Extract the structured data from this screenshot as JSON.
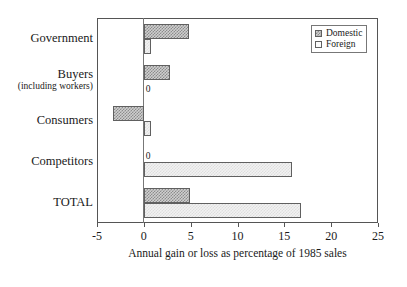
{
  "chart_data": {
    "type": "bar",
    "orientation": "horizontal",
    "title": "",
    "subtitle": "",
    "xlabel": "Annual gain or loss as percentage of 1985 sales",
    "ylabel": "",
    "xlim": [
      -5,
      25
    ],
    "xticks": [
      -5,
      0,
      5,
      10,
      15,
      20,
      25
    ],
    "xticklabels": [
      "-5",
      "0",
      "5",
      "10",
      "15",
      "20",
      "25"
    ],
    "grid": false,
    "legend_position": "top-right",
    "categories": [
      "Government",
      "Buyers",
      "Consumers",
      "Competitors",
      "TOTAL"
    ],
    "category_sublabels": [
      "",
      "(including workers)",
      "",
      "",
      ""
    ],
    "series": [
      {
        "name": "Domestic",
        "values": [
          4.8,
          2.8,
          -3.3,
          0,
          4.9
        ],
        "fill": "dark-checker"
      },
      {
        "name": "Foreign",
        "values": [
          0.8,
          0,
          0.8,
          15.8,
          16.8
        ],
        "fill": "light-checker"
      }
    ],
    "annotations": [
      {
        "text": "0",
        "category": "Buyers",
        "series": "Foreign"
      },
      {
        "text": "0",
        "category": "Competitors",
        "series": "Domestic"
      }
    ],
    "colors": {
      "domestic_fill": "#8c8c8c",
      "domestic_bg": "#cfcfcf",
      "foreign_fill": "#dedede",
      "foreign_bg": "#f2f2f2",
      "border": "#606060",
      "axis": "#555555",
      "text": "#1a1a1a",
      "background": "#ffffff"
    }
  },
  "legend": {
    "items": [
      {
        "label": "Domestic"
      },
      {
        "label": "Foreign"
      }
    ]
  }
}
